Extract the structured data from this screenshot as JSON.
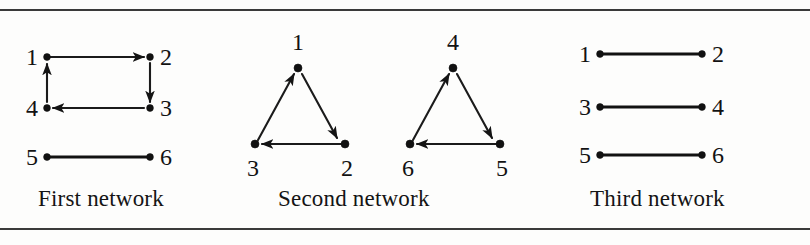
{
  "figure": {
    "background_color": "#fdfdfc",
    "ink_color": "#121212",
    "rule_color": "#3a3a3a"
  },
  "panels": [
    {
      "id": "first-network",
      "caption": "First network",
      "nodes": [
        {
          "id": "1",
          "label": "1"
        },
        {
          "id": "2",
          "label": "2"
        },
        {
          "id": "3",
          "label": "3"
        },
        {
          "id": "4",
          "label": "4"
        },
        {
          "id": "5",
          "label": "5"
        },
        {
          "id": "6",
          "label": "6"
        }
      ],
      "edges": [
        {
          "from": "1",
          "to": "2",
          "directed": true
        },
        {
          "from": "2",
          "to": "3",
          "directed": true
        },
        {
          "from": "3",
          "to": "4",
          "directed": true
        },
        {
          "from": "4",
          "to": "1",
          "directed": true
        },
        {
          "from": "5",
          "to": "6",
          "directed": false
        }
      ]
    },
    {
      "id": "second-network",
      "caption": "Second network",
      "nodes": [
        {
          "id": "1",
          "label": "1"
        },
        {
          "id": "2",
          "label": "2"
        },
        {
          "id": "3",
          "label": "3"
        },
        {
          "id": "4",
          "label": "4"
        },
        {
          "id": "5",
          "label": "5"
        },
        {
          "id": "6",
          "label": "6"
        }
      ],
      "edges": [
        {
          "from": "3",
          "to": "1",
          "directed": true
        },
        {
          "from": "1",
          "to": "2",
          "directed": true
        },
        {
          "from": "2",
          "to": "3",
          "directed": true
        },
        {
          "from": "6",
          "to": "4",
          "directed": true
        },
        {
          "from": "4",
          "to": "5",
          "directed": true
        },
        {
          "from": "5",
          "to": "6",
          "directed": true
        }
      ]
    },
    {
      "id": "third-network",
      "caption": "Third network",
      "nodes": [
        {
          "id": "1",
          "label": "1"
        },
        {
          "id": "2",
          "label": "2"
        },
        {
          "id": "3",
          "label": "3"
        },
        {
          "id": "4",
          "label": "4"
        },
        {
          "id": "5",
          "label": "5"
        },
        {
          "id": "6",
          "label": "6"
        }
      ],
      "edges": [
        {
          "from": "1",
          "to": "2",
          "directed": false
        },
        {
          "from": "3",
          "to": "4",
          "directed": false
        },
        {
          "from": "5",
          "to": "6",
          "directed": false
        }
      ]
    }
  ]
}
